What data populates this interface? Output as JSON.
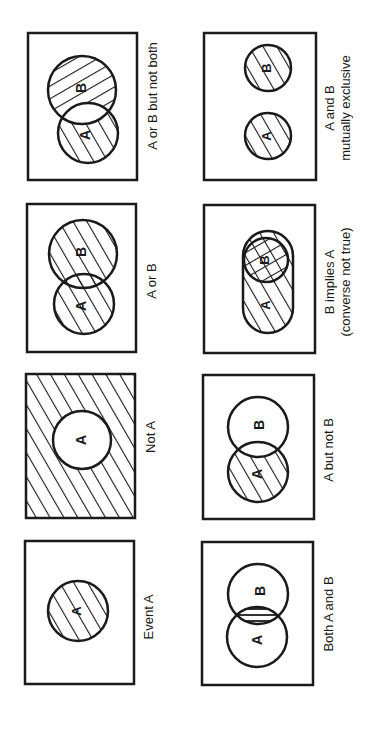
{
  "figure": {
    "orientation": "rotated 90 degrees counter-clockwise",
    "ink_color": "#1a1a1a",
    "background": "#ffffff",
    "panels": [
      {
        "id": "event-a",
        "label": "Event A",
        "circle_labels": [
          "A"
        ]
      },
      {
        "id": "both-a-and-b",
        "label": "Both A and B",
        "circle_labels": [
          "A",
          "B"
        ]
      },
      {
        "id": "not-a",
        "label": "Not A",
        "circle_labels": [
          "A"
        ]
      },
      {
        "id": "a-but-not-b",
        "label": "A but not B",
        "circle_labels": [
          "A",
          "B"
        ]
      },
      {
        "id": "a-or-b",
        "label": "A or B",
        "circle_labels": [
          "A",
          "B"
        ]
      },
      {
        "id": "b-implies-a",
        "label": "B implies A",
        "sublabel": "(converse not true)",
        "circle_labels": [
          "A",
          "B"
        ]
      },
      {
        "id": "a-or-b-not-both",
        "label": "A or B but not both",
        "circle_labels": [
          "A",
          "B"
        ]
      },
      {
        "id": "mutually-exclusive",
        "label": "A and B",
        "sublabel": "mutually exclusive",
        "circle_labels": [
          "A",
          "B"
        ]
      }
    ]
  }
}
